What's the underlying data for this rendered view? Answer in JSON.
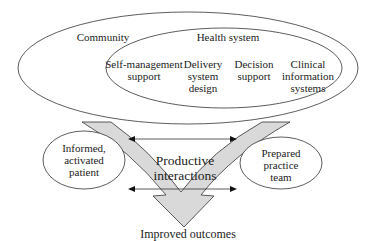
{
  "diagram": {
    "community": {
      "label": "Community"
    },
    "health_system": {
      "label": "Health system",
      "components": [
        {
          "label": "Self-management\nsupport"
        },
        {
          "label": "Delivery\nsystem\ndesign"
        },
        {
          "label": "Decision\nsupport"
        },
        {
          "label": "Clinical\ninformation\nsystems"
        }
      ]
    },
    "patient": {
      "label": "Informed,\nactivated\npatient"
    },
    "team": {
      "label": "Prepared\npractice\nteam"
    },
    "interactions": {
      "label": "Productive\ninteractions"
    },
    "outcome": {
      "label": "Improved outcomes"
    },
    "colors": {
      "stroke": "#333333",
      "arrow_fill": "#d9d9d9",
      "text": "#222222"
    }
  }
}
